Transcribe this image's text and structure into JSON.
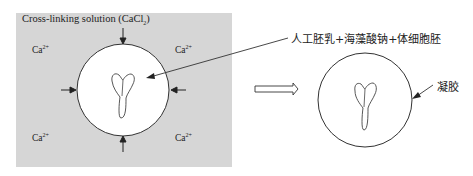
{
  "diagram": {
    "solution_box": {
      "label_main": "Cross-linking solution (CaCl",
      "label_sub": "2",
      "label_close": ")",
      "fill": "#d6d6d6"
    },
    "ions": [
      {
        "base": "Ca",
        "charge": "2+",
        "pos": "top-left"
      },
      {
        "base": "Ca",
        "charge": "2+",
        "pos": "top-right"
      },
      {
        "base": "Ca",
        "charge": "2+",
        "pos": "bottom-left"
      },
      {
        "base": "Ca",
        "charge": "2+",
        "pos": "bottom-right"
      }
    ],
    "mixture_label": "人工胚乳+海藻酸钠+体细胞胚",
    "gel_label": "凝胶",
    "process_arrow": "hollow-right-arrow",
    "colors": {
      "stroke": "#333333",
      "bead_fill": "#ffffff",
      "background": "#ffffff"
    }
  }
}
